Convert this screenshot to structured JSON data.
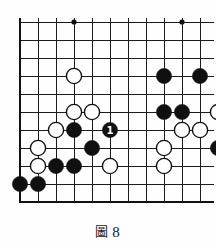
{
  "figure": {
    "caption_glyph": "圖",
    "caption_number": "8",
    "caption_full": "圖 8"
  },
  "board": {
    "type": "go-board-diagram",
    "visible_columns": 11,
    "visible_rows": 11,
    "cell_size": 18,
    "origin_x": 20,
    "origin_y": 22,
    "line_color": "#1b1b1b",
    "edge_color": "#111111",
    "black_color": "#101010",
    "white_color": "#ffffff",
    "white_border_color": "#101010",
    "background_color": "#fefefe",
    "edges": {
      "left": true,
      "bottom": true,
      "top": false,
      "right": false
    },
    "star_points": [
      {
        "col": 3,
        "row": 0
      },
      {
        "col": 9,
        "row": 0
      },
      {
        "col": 3,
        "row": 6
      },
      {
        "col": 9,
        "row": 6
      }
    ],
    "stones": [
      {
        "col": 3,
        "row": 3,
        "color": "white"
      },
      {
        "col": 8,
        "row": 3,
        "color": "black"
      },
      {
        "col": 10,
        "row": 3,
        "color": "black"
      },
      {
        "col": 3,
        "row": 6,
        "color": "black",
        "star": true
      },
      {
        "col": 3,
        "row": 5,
        "color": "white"
      },
      {
        "col": 4,
        "row": 5,
        "color": "white"
      },
      {
        "col": 8,
        "row": 5,
        "color": "black"
      },
      {
        "col": 9,
        "row": 5,
        "color": "black"
      },
      {
        "col": 11,
        "row": 5,
        "color": "white"
      },
      {
        "col": 2,
        "row": 6,
        "color": "white"
      },
      {
        "col": 5,
        "row": 6,
        "color": "black",
        "label": "1"
      },
      {
        "col": 9,
        "row": 6,
        "color": "white"
      },
      {
        "col": 10,
        "row": 6,
        "color": "white"
      },
      {
        "col": 1,
        "row": 7,
        "color": "white"
      },
      {
        "col": 4,
        "row": 7,
        "color": "black"
      },
      {
        "col": 8,
        "row": 7,
        "color": "white"
      },
      {
        "col": 11,
        "row": 7,
        "color": "black",
        "star": true
      },
      {
        "col": 1,
        "row": 8,
        "color": "white"
      },
      {
        "col": 2,
        "row": 8,
        "color": "black"
      },
      {
        "col": 3,
        "row": 8,
        "color": "black"
      },
      {
        "col": 5,
        "row": 8,
        "color": "white"
      },
      {
        "col": 8,
        "row": 8,
        "color": "white"
      },
      {
        "col": 0,
        "row": 9,
        "color": "black"
      },
      {
        "col": 1,
        "row": 9,
        "color": "black"
      }
    ],
    "move_labels": [
      {
        "col": 5,
        "row": 6,
        "text": "1",
        "stone_color": "black",
        "text_color": "#ffffff"
      }
    ]
  }
}
